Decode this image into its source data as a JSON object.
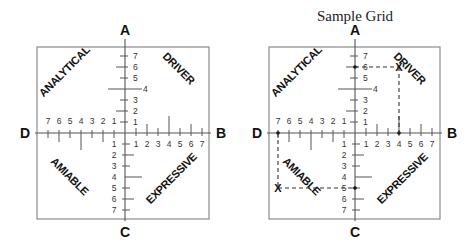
{
  "title": "Sample Grid",
  "poles": {
    "top": "A",
    "right": "B",
    "bottom": "C",
    "left": "D"
  },
  "quadrants": {
    "top_left": "ANALYTICAL",
    "top_right": "DRIVER",
    "bottom_left": "AMIABLE",
    "bottom_right": "EXPRESSIVE"
  },
  "scale_labels": [
    "1",
    "2",
    "3",
    "4",
    "5",
    "6",
    "7"
  ],
  "sample_plot": {
    "points": [
      {
        "axis": "A",
        "value": 6
      },
      {
        "axis": "B",
        "value": 4
      },
      {
        "axis": "C",
        "value": 5
      },
      {
        "axis": "D",
        "value": 7
      }
    ],
    "marks": [
      {
        "quadrant": "DRIVER",
        "label": "X",
        "x_axis": "B",
        "x_value": 4,
        "y_axis": "A",
        "y_value": 6
      },
      {
        "quadrant": "AMIABLE",
        "label": "X",
        "x_axis": "D",
        "x_value": 7,
        "y_axis": "C",
        "y_value": 5
      }
    ]
  },
  "chart_data": {
    "type": "diagram",
    "title": "Sample Grid",
    "axes": {
      "vertical": {
        "top": "A",
        "bottom": "C",
        "range": [
          1,
          7
        ]
      },
      "horizontal": {
        "left": "D",
        "right": "B",
        "range": [
          1,
          7
        ]
      }
    },
    "quadrants": [
      "ANALYTICAL",
      "DRIVER",
      "AMIABLE",
      "EXPRESSIVE"
    ],
    "sample_scores": {
      "A": 6,
      "B": 4,
      "C": 5,
      "D": 7
    },
    "plotted_marks": [
      {
        "quadrant": "DRIVER",
        "B": 4,
        "A": 6
      },
      {
        "quadrant": "AMIABLE",
        "D": 7,
        "C": 5
      }
    ]
  }
}
